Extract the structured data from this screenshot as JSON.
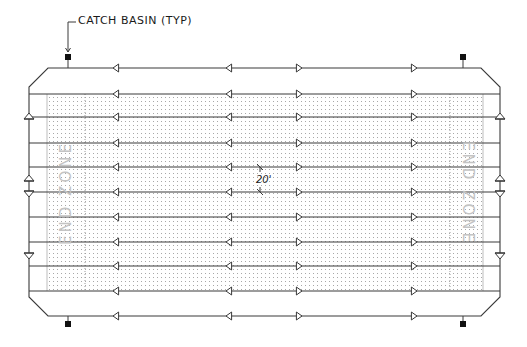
{
  "labels": {
    "catch_basin": "CATCH BASIN (TYP)",
    "dimension": "20'",
    "end_zone_left": "END ZONE",
    "end_zone_right": "END ZONE"
  },
  "colors": {
    "line": "#3a3a3a",
    "field_dots": "#9a9a9a",
    "end_zone_text": "#c4c4c4",
    "basin": "#111111"
  },
  "geometry": {
    "outline": {
      "left": 29,
      "right": 500,
      "top": 68,
      "bottom": 316,
      "chamfer_top_left": [
        48,
        87
      ],
      "chamfer": 19
    },
    "field": {
      "left": 47,
      "right": 483,
      "top": 94,
      "bottom": 291
    },
    "end_zone_dividers": [
      85,
      450
    ],
    "drain_lines_y": [
      68,
      94,
      117,
      143,
      167,
      192,
      217,
      242,
      266,
      291,
      316
    ],
    "left_arrow_x": [
      117,
      230
    ],
    "right_arrow_x": [
      298,
      413
    ],
    "edge_triangles": [
      {
        "y": 118,
        "dir": "up"
      },
      {
        "y": 180,
        "dir": "up"
      },
      {
        "y": 192,
        "dir": "down"
      },
      {
        "y": 254,
        "dir": "down"
      }
    ],
    "catch_basins": [
      {
        "x": 68,
        "y": 57,
        "stem_to": 68
      },
      {
        "x": 463,
        "y": 57,
        "stem_to": 68
      },
      {
        "x": 68,
        "y": 324,
        "stem_to": 316
      },
      {
        "x": 463,
        "y": 324,
        "stem_to": 316
      }
    ],
    "leader": {
      "from": [
        68,
        52
      ],
      "corner": [
        68,
        22
      ],
      "to": [
        76,
        22
      ]
    },
    "dimension_ticks": {
      "x": 260,
      "y1": 167,
      "y2": 192
    }
  }
}
